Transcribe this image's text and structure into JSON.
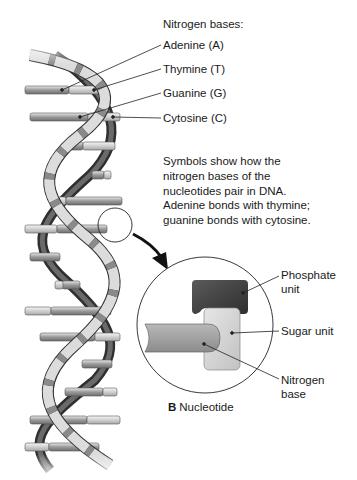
{
  "legend": {
    "title": "Nitrogen bases:",
    "items": [
      {
        "label": "Adenine (A)"
      },
      {
        "label": "Thymine (T)"
      },
      {
        "label": "Guanine (G)"
      },
      {
        "label": "Cytosine (C)"
      }
    ]
  },
  "description": {
    "lines": [
      "Symbols show how the",
      "nitrogen bases of the",
      "nucleotides pair in DNA.",
      "Adenine bonds with thymine;",
      "guanine bonds with cytosine."
    ]
  },
  "nucleotide": {
    "parts": [
      {
        "label_line1": "Phosphate",
        "label_line2": "unit"
      },
      {
        "label_line1": "Sugar unit",
        "label_line2": ""
      },
      {
        "label_line1": "Nitrogen",
        "label_line2": "base"
      }
    ],
    "caption_letter": "B",
    "caption_text": "Nucleotide"
  },
  "colors": {
    "strand_dark": "#3a3a3a",
    "strand_light": "#d8d8d8",
    "rung_dark": "#8a8a8a",
    "rung_light": "#cfcfcf",
    "phosphate": "#454545",
    "sugar": "#d4d4d4",
    "base": "#a0a0a0",
    "text": "#1a1a1a"
  }
}
